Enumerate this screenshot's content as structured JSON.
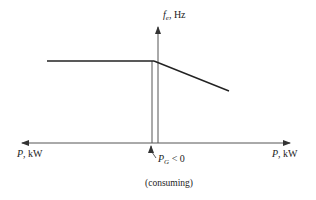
{
  "diagram": {
    "y_axis_label": {
      "var": "f",
      "sub": "e",
      "unit": ", Hz"
    },
    "x_axis_left_label": {
      "var": "P",
      "unit": ", kW"
    },
    "x_axis_right_label": {
      "var": "P",
      "unit": ", kW"
    },
    "operating_point_label": {
      "var": "P",
      "sub": "G",
      "relation": " < 0"
    },
    "operating_point_note": "(consuming)",
    "colors": {
      "line": "#222222",
      "axis": "#555555",
      "background": "#ffffff"
    }
  }
}
